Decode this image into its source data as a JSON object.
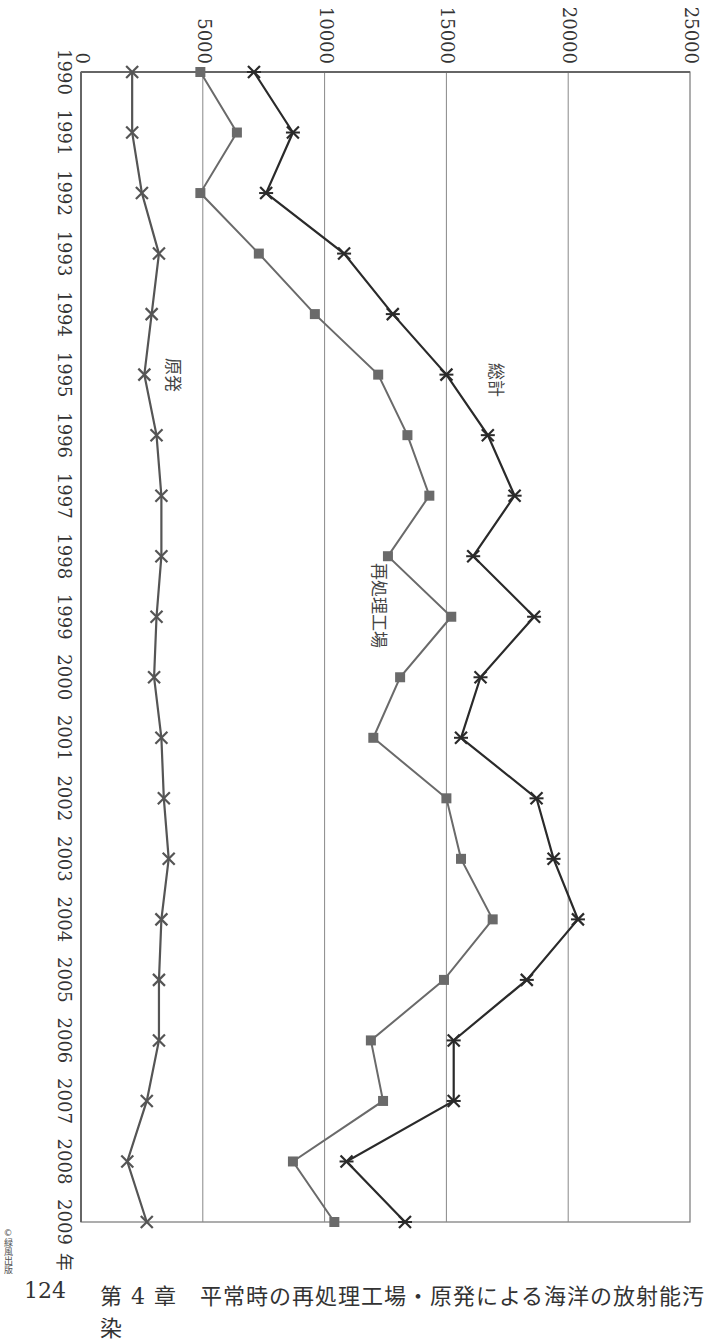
{
  "chart_data": {
    "type": "line",
    "orientation": "rotated-90-clockwise (years run top-to-bottom, values increase left-to-right)",
    "title": "",
    "xlabel": "年",
    "ylabel": "",
    "ylim": [
      0,
      25000
    ],
    "y_ticks": [
      0,
      5000,
      10000,
      15000,
      20000,
      25000
    ],
    "grid": true,
    "categories": [
      "1990",
      "1991",
      "1992",
      "1993",
      "1994",
      "1995",
      "1996",
      "1997",
      "1998",
      "1999",
      "2000",
      "2001",
      "2002",
      "2003",
      "2004",
      "2005",
      "2006",
      "2007",
      "2008",
      "2009"
    ],
    "series": [
      {
        "name": "総計",
        "marker": "asterisk",
        "color": "#2a2a2a",
        "values": [
          7100,
          8700,
          7600,
          10800,
          12800,
          15000,
          16700,
          17800,
          16100,
          18600,
          16400,
          15600,
          18700,
          19400,
          20400,
          18300,
          15300,
          15300,
          10900,
          13300
        ]
      },
      {
        "name": "再処理工場",
        "marker": "square",
        "color": "#6a6a6a",
        "values": [
          4900,
          6400,
          4900,
          7300,
          9600,
          12200,
          13400,
          14300,
          12600,
          15200,
          13100,
          12000,
          15000,
          15600,
          16900,
          14900,
          11900,
          12400,
          8700,
          10400
        ]
      },
      {
        "name": "原発",
        "marker": "x",
        "color": "#555555",
        "values": [
          2100,
          2100,
          2500,
          3200,
          2900,
          2600,
          3100,
          3300,
          3300,
          3100,
          3000,
          3300,
          3400,
          3600,
          3300,
          3200,
          3200,
          2700,
          1900,
          2700
        ]
      }
    ],
    "annotations": [
      {
        "text": "総計",
        "near_year": "1995"
      },
      {
        "text": "再処理工場",
        "near_year": "1999"
      },
      {
        "text": "原発",
        "near_year": "1995"
      }
    ],
    "legend": "inline labels"
  },
  "axis": {
    "year_unit": "年",
    "tick_labels": [
      "0",
      "5000",
      "10000",
      "15000",
      "20000",
      "25000"
    ]
  },
  "footer": {
    "page_number": "124",
    "chapter_title": "第 4 章　平常時の再処理工場・原発による海洋の放射能汚染",
    "copyright": "©緑風出版"
  }
}
